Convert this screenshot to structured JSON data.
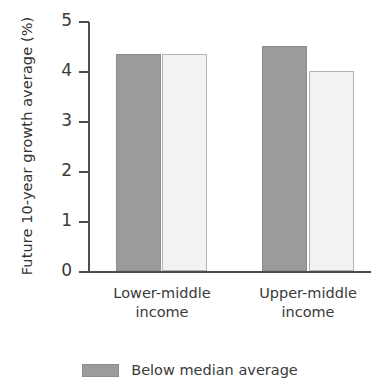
{
  "chart_data": {
    "type": "bar",
    "title": "",
    "xlabel": "",
    "ylabel": "Future 10-year growth average (%)",
    "categories": [
      "Lower-middle income",
      "Upper-middle income"
    ],
    "category_lines": [
      [
        "Lower-middle",
        "income"
      ],
      [
        "Upper-middle",
        "income"
      ]
    ],
    "series": [
      {
        "name": "Below median average",
        "values": [
          4.35,
          4.5
        ],
        "color": "#9b9b9b"
      },
      {
        "name": "",
        "values": [
          4.35,
          4.0
        ],
        "color": "#f2f2f2"
      }
    ],
    "ylim": [
      0,
      5
    ],
    "yticks": [
      0,
      1,
      2,
      3,
      4,
      5
    ],
    "ytick_labels": [
      "0",
      "1",
      "2",
      "3",
      "4",
      "5"
    ],
    "grid": false,
    "legend": {
      "position": "bottom",
      "entries": [
        {
          "label": "Below median average",
          "color": "#9b9b9b"
        }
      ]
    }
  },
  "axis": {
    "tick_0": "0",
    "tick_1": "1",
    "tick_2": "2",
    "tick_3": "3",
    "tick_4": "4",
    "tick_5": "5"
  },
  "groups": {
    "g0_line1": "Lower-middle",
    "g0_line2": "income",
    "g1_line1": "Upper-middle",
    "g1_line2": "income"
  },
  "legend": {
    "entry0_label": "Below median average"
  }
}
